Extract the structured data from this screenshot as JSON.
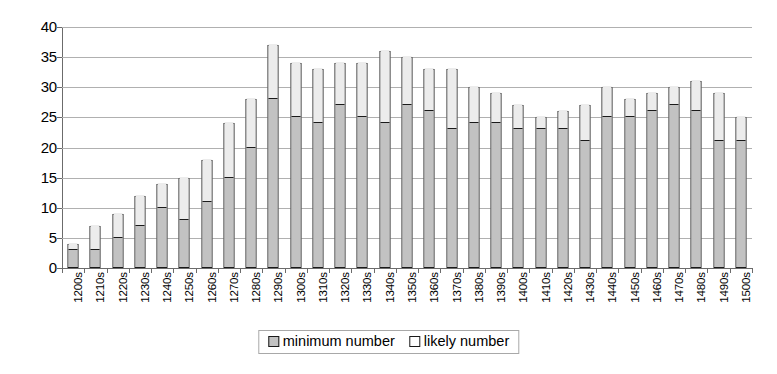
{
  "chart_data": {
    "type": "bar",
    "subtype": "stacked-vertical",
    "title": "",
    "subtitle": "",
    "xlabel": "",
    "ylabel": "",
    "ylim": [
      0,
      40
    ],
    "ytick_step": 5,
    "yticks": [
      40,
      35,
      30,
      25,
      20,
      15,
      10,
      5,
      0
    ],
    "grid": true,
    "grid_axis": "y",
    "legend_position": "bottom-center",
    "categories": [
      "1200s",
      "1210s",
      "1220s",
      "1230s",
      "1240s",
      "1250s",
      "1260s",
      "1270s",
      "1280s",
      "1290s",
      "1300s",
      "1310s",
      "1320s",
      "1330s",
      "1340s",
      "1350s",
      "1360s",
      "1370s",
      "1380s",
      "1390s",
      "1400s",
      "1410s",
      "1420s",
      "1430s",
      "1440s",
      "1450s",
      "1460s",
      "1470s",
      "1480s",
      "1490s",
      "1500s"
    ],
    "series": [
      {
        "name": "minimum number",
        "color": "#c2c2c2",
        "values": [
          3,
          3,
          5,
          7,
          10,
          8,
          11,
          15,
          20,
          28,
          25,
          24,
          27,
          25,
          24,
          27,
          26,
          23,
          24,
          24,
          23,
          23,
          23,
          21,
          25,
          25,
          26,
          27,
          26,
          21,
          21
        ]
      },
      {
        "name": "likely number",
        "color": "#ececec",
        "values": [
          1,
          4,
          4,
          5,
          4,
          7,
          7,
          9,
          8,
          9,
          9,
          9,
          7,
          9,
          12,
          8,
          7,
          10,
          6,
          5,
          4,
          2,
          3,
          6,
          5,
          3,
          3,
          3,
          5,
          8,
          4
        ]
      }
    ],
    "totals": [
      4,
      7,
      9,
      12,
      14,
      15,
      18,
      24,
      28,
      37,
      34,
      33,
      34,
      34,
      36,
      35,
      33,
      33,
      30,
      29,
      27,
      25,
      26,
      27,
      30,
      28,
      29,
      30,
      31,
      29,
      25
    ]
  },
  "legend": {
    "items": [
      {
        "label": "minimum number",
        "swatch": "minimum"
      },
      {
        "label": "likely number",
        "swatch": "likely"
      }
    ]
  },
  "colors": {
    "minimum_fill": "#c2c2c2",
    "likely_fill": "#ececec",
    "bar_outline": "#1a1a1a",
    "gridline": "#b0b0b0",
    "axis": "#6b6b6b",
    "background": "#ffffff"
  }
}
